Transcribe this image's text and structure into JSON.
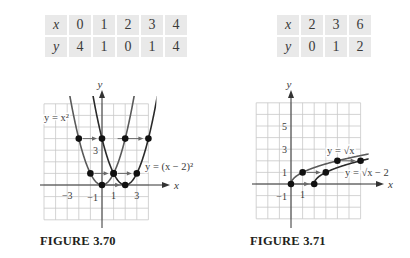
{
  "tables": {
    "left": {
      "x_label": "x",
      "y_label": "y",
      "x": [
        "0",
        "1",
        "2",
        "3",
        "4"
      ],
      "y": [
        "4",
        "1",
        "0",
        "1",
        "4"
      ]
    },
    "right": {
      "x_label": "x",
      "y_label": "y",
      "x": [
        "2",
        "3",
        "6"
      ],
      "y": [
        "0",
        "1",
        "2"
      ]
    }
  },
  "figures": {
    "left": {
      "caption": "FIGURE 3.70"
    },
    "right": {
      "caption": "FIGURE 3.71"
    }
  },
  "chart_data": [
    {
      "type": "line",
      "title": "FIGURE 3.70",
      "xlabel": "x",
      "ylabel": "y",
      "grid": true,
      "xlim": [
        -5,
        4.7
      ],
      "ylim": [
        -3.3,
        7
      ],
      "x_tick_labels": [
        {
          "value": -3,
          "label": "-3"
        },
        {
          "value": 1,
          "label": "1"
        },
        {
          "value": 3,
          "label": "3"
        }
      ],
      "y_tick_labels": [
        {
          "value": 3,
          "label": "3"
        },
        {
          "value": -1,
          "label": "-1"
        }
      ],
      "series": [
        {
          "name": "y = x^2",
          "function": "x^2",
          "points": [
            [
              -2,
              4
            ],
            [
              -1,
              1
            ],
            [
              0,
              0
            ],
            [
              1,
              1
            ],
            [
              2,
              4
            ]
          ]
        },
        {
          "name": "y = (x - 2)^2",
          "function": "(x-2)^2",
          "points": [
            [
              0,
              4
            ],
            [
              1,
              1
            ],
            [
              2,
              0
            ],
            [
              3,
              1
            ],
            [
              4,
              4
            ]
          ]
        }
      ],
      "annotations": [
        {
          "type": "arrow",
          "from": [
            -2,
            4
          ],
          "to": [
            0,
            4
          ]
        },
        {
          "type": "arrow",
          "from": [
            1,
            4
          ],
          "to": [
            4,
            4
          ]
        },
        {
          "type": "arrow",
          "from": [
            -1,
            1
          ],
          "to": [
            1,
            1
          ]
        },
        {
          "type": "arrow",
          "from": [
            1,
            1
          ],
          "to": [
            3,
            1
          ]
        },
        {
          "type": "arrow",
          "from": [
            0,
            0
          ],
          "to": [
            2,
            0
          ]
        }
      ],
      "labels": {
        "curve1": "y = x²",
        "curve2": "y = (x − 2)²",
        "x_axis": "x",
        "y_axis": "y"
      }
    },
    {
      "type": "line",
      "title": "FIGURE 3.71",
      "xlabel": "x",
      "ylabel": "y",
      "grid": true,
      "xlim": [
        -3.2,
        7
      ],
      "ylim": [
        -3.2,
        7.2
      ],
      "x_tick_labels": [
        {
          "value": 1,
          "label": "1"
        }
      ],
      "y_tick_labels": [
        {
          "value": 5,
          "label": "5"
        },
        {
          "value": 3,
          "label": "3"
        },
        {
          "value": 1,
          "label": "1"
        },
        {
          "value": -1,
          "label": "-1"
        }
      ],
      "series": [
        {
          "name": "y = √x",
          "function": "sqrt(x)",
          "points": [
            [
              0,
              0
            ],
            [
              1,
              1
            ],
            [
              4,
              2
            ]
          ]
        },
        {
          "name": "y = √(x − 2)",
          "function": "sqrt(x-2)",
          "points": [
            [
              2,
              0
            ],
            [
              3,
              1
            ],
            [
              6,
              2
            ]
          ]
        }
      ],
      "annotations": [
        {
          "type": "arrow",
          "from": [
            0,
            0
          ],
          "to": [
            2,
            0
          ]
        },
        {
          "type": "arrow",
          "from": [
            1,
            1
          ],
          "to": [
            3,
            1
          ]
        },
        {
          "type": "arrow",
          "from": [
            4,
            2
          ],
          "to": [
            6,
            2
          ]
        }
      ],
      "labels": {
        "curve1": "y = √x",
        "curve2": "y = √x − 2",
        "x_axis": "x",
        "y_axis": "y"
      }
    }
  ]
}
